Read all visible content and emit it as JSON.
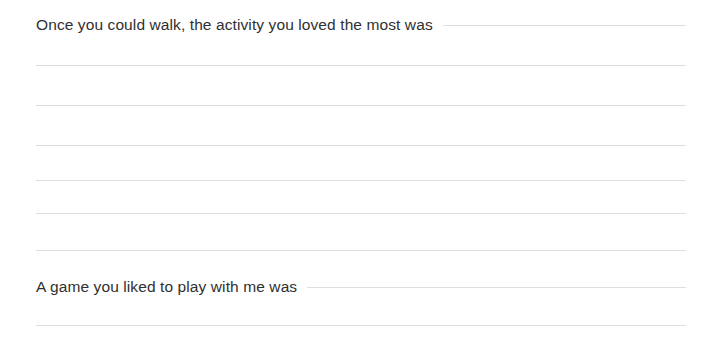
{
  "page": {
    "background_color": "#ffffff",
    "text_color": "#2f3031",
    "rule_color": "#dedede",
    "width": 714,
    "height": 353
  },
  "prompts": [
    {
      "id": "prompt-activity-you-loved",
      "text": "Once you could walk, the activity you loved the most was",
      "top": 15,
      "fill_rule": true
    },
    {
      "id": "prompt-game-you-liked",
      "text": "A game you liked to play with me was",
      "top": 277,
      "fill_rule": true
    }
  ],
  "rule_lines": [
    {
      "id": "rule-line-1",
      "top": 65,
      "left": 36,
      "right": 28
    },
    {
      "id": "rule-line-2",
      "top": 105,
      "left": 36,
      "right": 28
    },
    {
      "id": "rule-line-3",
      "top": 145,
      "left": 36,
      "right": 28
    },
    {
      "id": "rule-line-4",
      "top": 180,
      "left": 36,
      "right": 28
    },
    {
      "id": "rule-line-5",
      "top": 213,
      "left": 36,
      "right": 28
    },
    {
      "id": "rule-line-6",
      "top": 250,
      "left": 36,
      "right": 28
    },
    {
      "id": "rule-line-7",
      "top": 325,
      "left": 36,
      "right": 28
    }
  ],
  "answer_areas": [
    {
      "id": "answer-area-activity",
      "top": 30,
      "height": 235
    },
    {
      "id": "answer-area-game",
      "top": 300,
      "height": 50
    }
  ]
}
